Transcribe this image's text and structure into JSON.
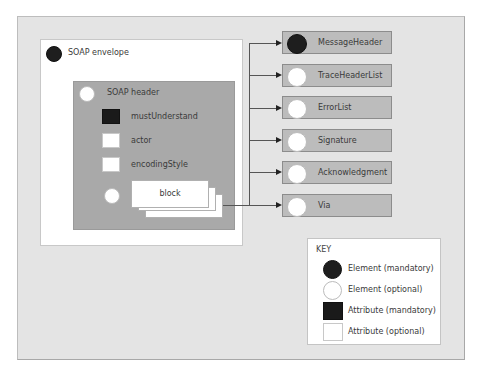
{
  "diagram": {
    "envelope": {
      "label": "SOAP envelope",
      "icon": "element-mandatory"
    },
    "header": {
      "label": "SOAP header",
      "icon": "element-optional",
      "attributes": [
        {
          "label": "mustUnderstand",
          "icon": "attribute-mandatory"
        },
        {
          "label": "actor",
          "icon": "attribute-optional"
        },
        {
          "label": "encodingStyle",
          "icon": "attribute-optional"
        }
      ],
      "block": {
        "label": "block",
        "icon": "element-optional"
      }
    },
    "header_elements": [
      {
        "label": "MessageHeader",
        "icon": "element-mandatory"
      },
      {
        "label": "TraceHeaderList",
        "icon": "element-optional"
      },
      {
        "label": "ErrorList",
        "icon": "element-optional"
      },
      {
        "label": "Signature",
        "icon": "element-optional"
      },
      {
        "label": "Acknowledgment",
        "icon": "element-optional"
      },
      {
        "label": "Via",
        "icon": "element-optional"
      }
    ],
    "key": {
      "title": "KEY",
      "items": [
        {
          "label": "Element (mandatory)",
          "icon": "element-mandatory"
        },
        {
          "label": "Element (optional)",
          "icon": "element-optional"
        },
        {
          "label": "Attribute (mandatory)",
          "icon": "attribute-mandatory"
        },
        {
          "label": "Attribute (optional)",
          "icon": "attribute-optional"
        }
      ]
    },
    "colors": {
      "background": "#e4e4e4",
      "envelope": "#ffffff",
      "header_box": "#a9a9a9",
      "element_box": "#bcbcbc",
      "mandatory": "#1e1e1e",
      "optional": "#ffffff"
    }
  }
}
